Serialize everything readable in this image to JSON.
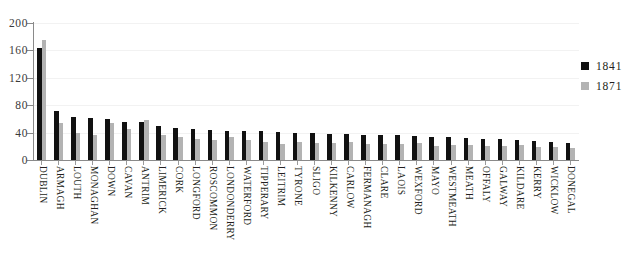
{
  "chart_data": {
    "type": "bar",
    "title": "",
    "xlabel": "",
    "ylabel": "",
    "ylim": [
      0,
      200
    ],
    "yticks": [
      0,
      40,
      80,
      120,
      160,
      200
    ],
    "grid": true,
    "legend_position": "right",
    "categories": [
      "DUBLIN",
      "ARMAGH",
      "LOUTH",
      "MONAGHAN",
      "DOWN",
      "CAVAN",
      "ANTRIM",
      "LIMERICK",
      "CORK",
      "LONGFORD",
      "ROSCOMMON",
      "LONDONDERRY",
      "WATERFORD",
      "TIPPERARY",
      "LEITRIM",
      "TYRONE",
      "SLIGO",
      "KILKENNY",
      "CARLOW",
      "FERMANAGH",
      "CLARE",
      "LAOIS",
      "WEXFORD",
      "MAYO",
      "WESTMEATH",
      "MEATH",
      "OFFALY",
      "GALWAY",
      "KILDARE",
      "KERRY",
      "WICKLOW",
      "DONEGAL"
    ],
    "series": [
      {
        "name": "1841",
        "color": "#111111",
        "values": [
          163,
          72,
          63,
          62,
          60,
          56,
          55,
          50,
          47,
          45,
          44,
          43,
          43,
          42,
          41,
          40,
          39,
          38,
          38,
          37,
          36,
          36,
          35,
          34,
          33,
          32,
          31,
          30,
          29,
          28,
          26,
          25
        ]
      },
      {
        "name": "1871",
        "color": "#b3b3b3",
        "values": [
          175,
          54,
          40,
          36,
          54,
          45,
          58,
          37,
          34,
          30,
          29,
          33,
          29,
          27,
          24,
          27,
          25,
          25,
          26,
          24,
          23,
          23,
          25,
          21,
          22,
          22,
          21,
          20,
          22,
          19,
          19,
          18
        ]
      }
    ]
  },
  "legend": {
    "items": [
      {
        "label": "1841",
        "color": "#111111"
      },
      {
        "label": "1871",
        "color": "#b3b3b3"
      }
    ]
  },
  "axis": {
    "y_labels": [
      "200",
      "160",
      "120",
      "80",
      "40",
      "0"
    ]
  }
}
